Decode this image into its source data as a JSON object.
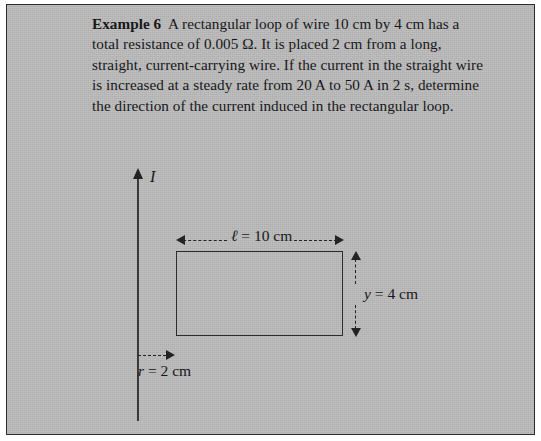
{
  "page": {
    "background_color": "#b4b4b4",
    "border_color": "#2b2b2b",
    "ink_color": "#17171a"
  },
  "problem": {
    "label": "Example 6",
    "body": "A rectangular loop of wire 10 cm by 4 cm has a total resistance of 0.005 Ω. It is placed 2 cm from a long, straight, current-carrying wire. If the current in the straight wire is increased at a steady rate from 20 A to 50 A in 2 s, determine the direction of the current induced in the rectangular loop.",
    "given": {
      "loop_length_cm": 10,
      "loop_width_cm": 4,
      "resistance_ohm": 0.005,
      "distance_from_wire_cm": 2,
      "current_initial_A": 20,
      "current_final_A": 50,
      "time_interval_s": 2
    }
  },
  "figure": {
    "current_label": "I",
    "length_label": "ℓ = 10 cm",
    "width_label": "y = 4 cm",
    "distance_label": "r = 2 cm",
    "wire_name": "long straight current-carrying wire",
    "loop_name": "rectangular loop of wire"
  }
}
